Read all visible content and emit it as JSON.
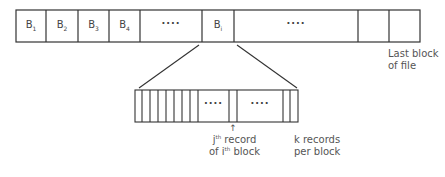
{
  "file_row": {
    "blocks": [
      {
        "label": "B",
        "sub": "1"
      },
      {
        "label": "B",
        "sub": "2"
      },
      {
        "label": "B",
        "sub": "3"
      },
      {
        "label": "B",
        "sub": "4"
      },
      {
        "label": "····",
        "sub": ""
      },
      {
        "label": "B",
        "sub": "i"
      },
      {
        "label": "····",
        "sub": ""
      },
      {
        "label": "",
        "sub": ""
      },
      {
        "label": "",
        "sub": ""
      }
    ],
    "last_block_label_line1": "Last block",
    "last_block_label_line2": "of file"
  },
  "block_detail": {
    "dots_1": "····",
    "dots_2": "····",
    "arrow": "↑",
    "record_label_j": "j",
    "record_label_th1": "th",
    "record_label_rest1": " record",
    "record_label_of": "of i",
    "record_label_th2": "th",
    "record_label_rest2": " block",
    "k_label_line1": "k records",
    "k_label_line2": "per block"
  },
  "colors": {
    "stroke": "#333333",
    "text": "#555555"
  }
}
